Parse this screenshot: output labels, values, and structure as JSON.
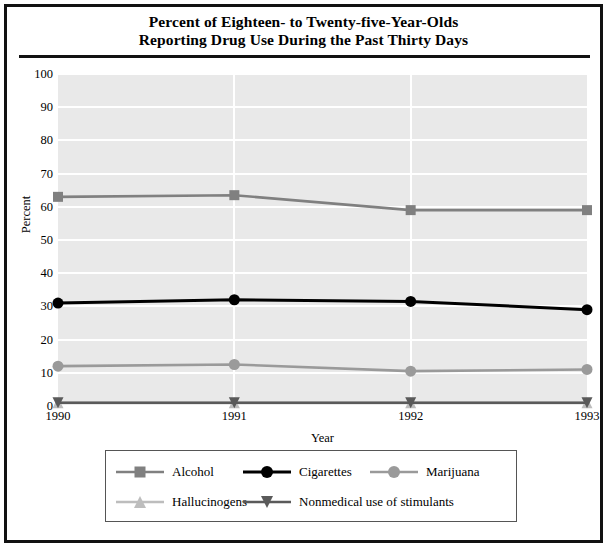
{
  "title": {
    "line1": "Percent of Eighteen- to Twenty-five-Year-Olds",
    "line2": "Reporting Drug Use During the Past Thirty Days"
  },
  "axis": {
    "ylabel": "Percent",
    "xlabel": "Year"
  },
  "legend": {
    "entries": [
      {
        "label": "Alcohol",
        "marker": "square",
        "color": "#808080"
      },
      {
        "label": "Cigarettes",
        "marker": "circle",
        "color": "#000000"
      },
      {
        "label": "Marijuana",
        "marker": "circle",
        "color": "#9a9a9a"
      },
      {
        "label": "Hallucinogens",
        "marker": "triangle-up",
        "color": "#bdbdbd"
      },
      {
        "label": "Nonmedical use of stimulants",
        "marker": "triangle-down",
        "color": "#5a5a5a"
      }
    ]
  },
  "chart_data": {
    "type": "line",
    "title": "Percent of Eighteen- to Twenty-five-Year-Olds Reporting Drug Use During the Past Thirty Days",
    "xlabel": "Year",
    "ylabel": "Percent",
    "categories": [
      "1990",
      "1991",
      "1992",
      "1993"
    ],
    "x": [
      1990,
      1991,
      1992,
      1993
    ],
    "ylim": [
      0,
      100
    ],
    "yticks": [
      0,
      10,
      20,
      30,
      40,
      50,
      60,
      70,
      80,
      90,
      100
    ],
    "grid": true,
    "legend_position": "bottom",
    "series": [
      {
        "name": "Alcohol",
        "values": [
          63,
          63.5,
          59,
          59
        ],
        "color": "#808080",
        "marker": "square"
      },
      {
        "name": "Cigarettes",
        "values": [
          31,
          32,
          31.5,
          29
        ],
        "color": "#000000",
        "marker": "circle"
      },
      {
        "name": "Marijuana",
        "values": [
          12,
          12.5,
          10.5,
          11
        ],
        "color": "#9a9a9a",
        "marker": "circle"
      },
      {
        "name": "Hallucinogens",
        "values": [
          1,
          1,
          1,
          1
        ],
        "color": "#bdbdbd",
        "marker": "triangle-up"
      },
      {
        "name": "Nonmedical use of stimulants",
        "values": [
          1,
          1,
          1,
          1
        ],
        "color": "#5a5a5a",
        "marker": "triangle-down"
      }
    ]
  }
}
